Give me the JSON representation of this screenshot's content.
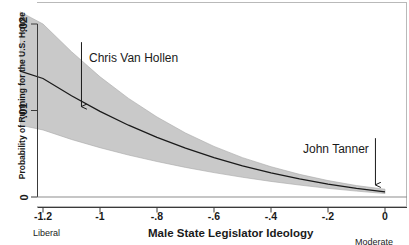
{
  "chart_data": {
    "type": "line",
    "title": "",
    "xlabel": "Male State Legislator Ideology",
    "ylabel": "Probability of Running for the U.S. House",
    "xlim": [
      -1.28,
      0.0
    ],
    "ylim": [
      0,
      0.021
    ],
    "xticks": [
      -1.2,
      -1,
      -0.8,
      -0.6,
      -0.4,
      -0.2,
      0
    ],
    "xticklabels": [
      "-1.2",
      "-1",
      "-.8",
      "-.6",
      "-.4",
      "-.2",
      "0"
    ],
    "yticks": [
      0,
      0.01,
      0.02
    ],
    "yticklabels": [
      "0",
      ".01",
      ".02"
    ],
    "grid": false,
    "legend": "none",
    "axis_end_labels": {
      "left": "Liberal",
      "right": "Moderate"
    },
    "series": [
      {
        "name": "Predicted probability",
        "style": "solid-line",
        "color": "#1a1a1a",
        "x": [
          -1.28,
          -1.2,
          -1.1,
          -1.0,
          -0.9,
          -0.8,
          -0.7,
          -0.6,
          -0.5,
          -0.4,
          -0.3,
          -0.2,
          -0.1,
          0.0
        ],
        "y": [
          0.01455,
          0.0137,
          0.0117,
          0.0099,
          0.0083,
          0.0069,
          0.00565,
          0.00455,
          0.0036,
          0.0028,
          0.0021,
          0.0015,
          0.001,
          0.0006
        ]
      },
      {
        "name": "95% confidence interval upper",
        "style": "shaded-band",
        "color": "#c9c9c9",
        "x": [
          -1.28,
          -1.2,
          -1.1,
          -1.0,
          -0.9,
          -0.8,
          -0.7,
          -0.6,
          -0.5,
          -0.4,
          -0.3,
          -0.2,
          -0.1,
          0.0
        ],
        "y": [
          0.0214,
          0.02,
          0.0168,
          0.0139,
          0.0114,
          0.00925,
          0.0074,
          0.00585,
          0.00455,
          0.0035,
          0.00262,
          0.0019,
          0.00132,
          0.0009
        ]
      },
      {
        "name": "95% confidence interval lower",
        "style": "shaded-band",
        "color": "#c9c9c9",
        "x": [
          -1.28,
          -1.2,
          -1.1,
          -1.0,
          -0.9,
          -0.8,
          -0.7,
          -0.6,
          -0.5,
          -0.4,
          -0.3,
          -0.2,
          -0.1,
          0.0
        ],
        "y": [
          0.0083,
          0.00775,
          0.00665,
          0.0057,
          0.00485,
          0.0041,
          0.00342,
          0.00282,
          0.00228,
          0.0018,
          0.00138,
          0.001,
          0.00068,
          0.0004
        ]
      }
    ],
    "annotations": [
      {
        "label": "Chris Van Hollen",
        "arrow": {
          "from_x": -1.065,
          "from_y": 0.0179,
          "to_x": -1.065,
          "to_y": 0.01045
        }
      },
      {
        "label": "John Tanner",
        "arrow": {
          "from_x": -0.0335,
          "from_y": 0.0068,
          "to_x": -0.0335,
          "to_y": 0.0014
        }
      }
    ]
  }
}
